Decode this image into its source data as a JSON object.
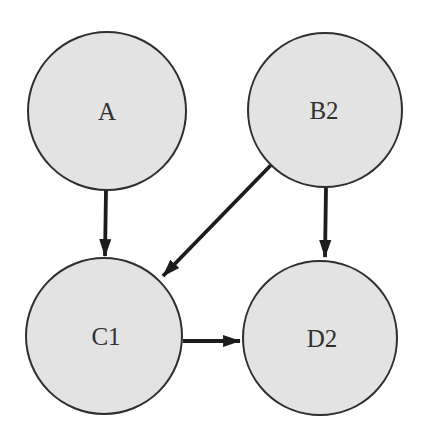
{
  "diagram": {
    "type": "directed-graph",
    "style": {
      "background": "#ffffff",
      "node_fill": "#e3e3e3",
      "node_stroke": "#2e2e2e",
      "edge_color": "#1c1c1c",
      "label_color": "#2f2f2f"
    },
    "nodes": [
      {
        "id": "A",
        "label": "A"
      },
      {
        "id": "B2",
        "label": "B2"
      },
      {
        "id": "C1",
        "label": "C1"
      },
      {
        "id": "D2",
        "label": "D2"
      }
    ],
    "edges": [
      {
        "from": "A",
        "to": "C1"
      },
      {
        "from": "B2",
        "to": "C1"
      },
      {
        "from": "B2",
        "to": "D2"
      },
      {
        "from": "C1",
        "to": "D2"
      }
    ]
  }
}
